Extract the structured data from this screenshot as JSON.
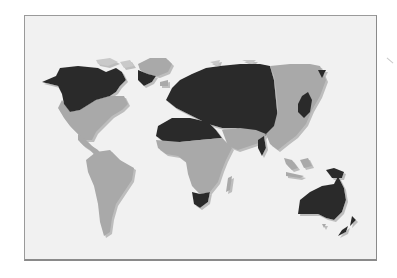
{
  "image": {
    "subject": "world map",
    "style": "grayscale two-tone regional map with embossed shadow",
    "colors": {
      "background": "#ffffff",
      "frame_fill": "#f1f1f1",
      "frame_border": "#9a9a9a",
      "dark_region": "#2b2b2b",
      "light_region": "#a9a9a9",
      "shadow": "#c4c4c4"
    },
    "regions": [
      {
        "name": "north-america-north",
        "shade": "dark"
      },
      {
        "name": "north-america-south",
        "shade": "light"
      },
      {
        "name": "greenland-north",
        "shade": "light"
      },
      {
        "name": "greenland-south",
        "shade": "dark"
      },
      {
        "name": "south-america",
        "shade": "light"
      },
      {
        "name": "europe-north-asia",
        "shade": "dark"
      },
      {
        "name": "north-africa",
        "shade": "dark"
      },
      {
        "name": "central-africa",
        "shade": "light"
      },
      {
        "name": "south-africa",
        "shade": "dark"
      },
      {
        "name": "madagascar",
        "shade": "light"
      },
      {
        "name": "middle-east",
        "shade": "light"
      },
      {
        "name": "east-asia",
        "shade": "light"
      },
      {
        "name": "japan-korea",
        "shade": "dark"
      },
      {
        "name": "india-south",
        "shade": "dark"
      },
      {
        "name": "southeast-asia",
        "shade": "light"
      },
      {
        "name": "new-guinea",
        "shade": "dark"
      },
      {
        "name": "australia",
        "shade": "dark"
      },
      {
        "name": "new-zealand",
        "shade": "dark"
      }
    ]
  }
}
